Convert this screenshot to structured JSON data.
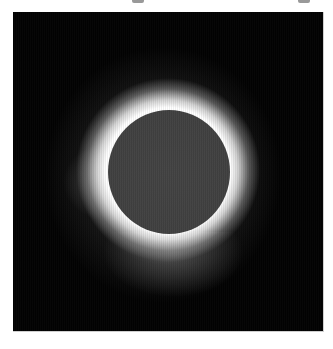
{
  "image": {
    "subject": "Total solar eclipse",
    "description": "Dark moon disc centered in a black frame, surrounded by a bright white corona glow",
    "colors": {
      "page_background": "#ffffff",
      "sky": "#020202",
      "moon": "#424242",
      "corona": "#ffffff"
    }
  }
}
